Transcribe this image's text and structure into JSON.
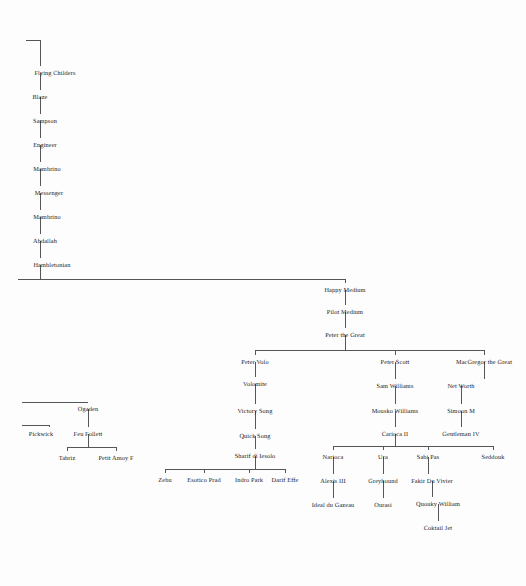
{
  "diagram": {
    "kind": "pedigree-chart",
    "background_color": "#fdfdfd",
    "line_color": "#55555a",
    "text_color": "#1c1c1c",
    "nodes": [
      {
        "id": "flying-childers",
        "label": "Flying Childers",
        "x": 55,
        "y": 71
      },
      {
        "id": "blaze",
        "label": "Blaze",
        "x": 40,
        "y": 95
      },
      {
        "id": "sampson",
        "label": "Sampson",
        "x": 45,
        "y": 119
      },
      {
        "id": "engineer",
        "label": "Engineer",
        "x": 45,
        "y": 143
      },
      {
        "id": "mambrino-1",
        "label": "Mambrino",
        "x": 47,
        "y": 167
      },
      {
        "id": "messenger",
        "label": "Messenger",
        "x": 49,
        "y": 191
      },
      {
        "id": "mambrino-2",
        "label": "Mambrino",
        "x": 47,
        "y": 215
      },
      {
        "id": "abdallah",
        "label": "Abdallah",
        "x": 45,
        "y": 239
      },
      {
        "id": "hambletonian",
        "label": "Hambletonian",
        "x": 52,
        "y": 263
      },
      {
        "id": "happy-medium",
        "label": "Happy Medium",
        "x": 345,
        "y": 288
      },
      {
        "id": "pilot-medium",
        "label": "Pilot Medium",
        "x": 345,
        "y": 310
      },
      {
        "id": "peter-the-great",
        "label": "Peter the Great",
        "x": 345,
        "y": 333
      },
      {
        "id": "peter-volo",
        "label": "Peter Volo",
        "x": 255,
        "y": 360
      },
      {
        "id": "volomite",
        "label": "Volomite",
        "x": 255,
        "y": 382
      },
      {
        "id": "victory-song",
        "label": "Victory Song",
        "x": 255,
        "y": 409
      },
      {
        "id": "quick-song",
        "label": "Quick Song",
        "x": 255,
        "y": 434
      },
      {
        "id": "sharif-di-iesolo",
        "label": "Sharif di Iesolo",
        "x": 255,
        "y": 454
      },
      {
        "id": "zebu",
        "label": "Zebu",
        "x": 165,
        "y": 478
      },
      {
        "id": "esotico-prad",
        "label": "Esotico Prad",
        "x": 204,
        "y": 478
      },
      {
        "id": "indro-park",
        "label": "Indro Park",
        "x": 249,
        "y": 478
      },
      {
        "id": "darif-effe",
        "label": "Darif Effe",
        "x": 285,
        "y": 478
      },
      {
        "id": "peter-scott",
        "label": "Peter Scott",
        "x": 395,
        "y": 360
      },
      {
        "id": "sam-williams",
        "label": "Sam Williams",
        "x": 395,
        "y": 384
      },
      {
        "id": "mousko-williams",
        "label": "Mousko Williams",
        "x": 395,
        "y": 409
      },
      {
        "id": "carioca-ii",
        "label": "Carioca II",
        "x": 395,
        "y": 432
      },
      {
        "id": "macgregor-the-great",
        "label": "MacGregor the Great",
        "x": 484,
        "y": 360
      },
      {
        "id": "net-worth",
        "label": "Net Worth",
        "x": 461,
        "y": 384
      },
      {
        "id": "simoon-m",
        "label": "Simoon M",
        "x": 461,
        "y": 409
      },
      {
        "id": "gentleman-iv",
        "label": "Gentleman IV",
        "x": 461,
        "y": 432
      },
      {
        "id": "narioca",
        "label": "Narioca",
        "x": 333,
        "y": 455
      },
      {
        "id": "ura",
        "label": "Ura",
        "x": 383,
        "y": 455
      },
      {
        "id": "sabi-pas",
        "label": "Sabi Pas",
        "x": 428,
        "y": 455
      },
      {
        "id": "seddouk",
        "label": "Seddouk",
        "x": 493,
        "y": 455
      },
      {
        "id": "alexis-iii",
        "label": "Alexis III",
        "x": 333,
        "y": 479
      },
      {
        "id": "greyhound",
        "label": "Greyhound",
        "x": 383,
        "y": 479
      },
      {
        "id": "fakir-du-vivier",
        "label": "Fakir Du Vivier",
        "x": 432,
        "y": 479
      },
      {
        "id": "ideal-du-gazeau",
        "label": "Ideal du Gazeau",
        "x": 333,
        "y": 503
      },
      {
        "id": "ourasi",
        "label": "Ourasi",
        "x": 383,
        "y": 503
      },
      {
        "id": "quouky-william",
        "label": "Quouky William",
        "x": 438,
        "y": 502
      },
      {
        "id": "coktail-jet",
        "label": "Coktail Jet",
        "x": 438,
        "y": 526
      },
      {
        "id": "ogaden",
        "label": "Ogaden",
        "x": 88,
        "y": 407
      },
      {
        "id": "pickwick",
        "label": "Pickwick",
        "x": 41,
        "y": 432
      },
      {
        "id": "feu-follett",
        "label": "Feu Follett",
        "x": 88,
        "y": 432
      },
      {
        "id": "tabriz",
        "label": "Tabriz",
        "x": 67,
        "y": 456
      },
      {
        "id": "petit-amoy-f",
        "label": "Petit Amoy F",
        "x": 116,
        "y": 456
      }
    ]
  }
}
